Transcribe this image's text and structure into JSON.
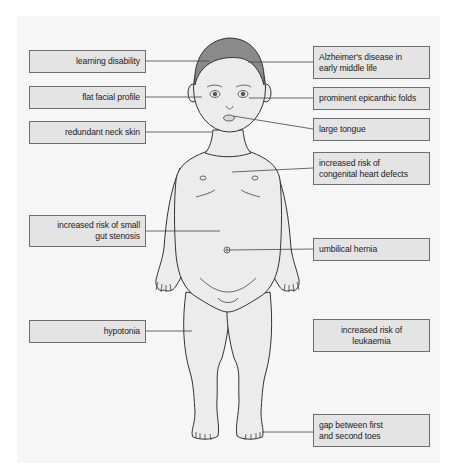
{
  "colors": {
    "panel_background": "#f6f6f6",
    "label_box_fill": "#e4e4e4",
    "label_box_border": "#6e6e6e",
    "skin_fill": "#ececec",
    "hair_fill": "#8a8a8a",
    "outline": "#333333"
  },
  "labels": {
    "left": [
      {
        "id": "learning-disability",
        "text": "learning disability"
      },
      {
        "id": "flat-facial-profile",
        "text": "flat facial profile"
      },
      {
        "id": "redundant-neck-skin",
        "text": "redundant neck skin"
      },
      {
        "id": "small-gut-stenosis",
        "text": "increased risk of small\ngut stenosis"
      },
      {
        "id": "hypotonia",
        "text": "hypotonia"
      }
    ],
    "right": [
      {
        "id": "alzheimers",
        "text": "Alzheimer's disease in\nearly middle life"
      },
      {
        "id": "epicanthic-folds",
        "text": "prominent epicanthic folds"
      },
      {
        "id": "large-tongue",
        "text": "large tongue"
      },
      {
        "id": "heart-defects",
        "text": "increased risk of\ncongenital heart defects"
      },
      {
        "id": "umbilical-hernia",
        "text": "umbilical hernia"
      },
      {
        "id": "leukaemia",
        "text": "increased risk of\nleukaemia"
      },
      {
        "id": "toe-gap",
        "text": "gap between first\nand second toes"
      }
    ]
  }
}
